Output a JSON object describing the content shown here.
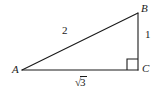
{
  "figure": {
    "type": "right-triangle-diagram",
    "background_color": "#ffffff",
    "stroke_color": "#1a1a1a",
    "vertices": [
      {
        "name": "A",
        "label": "A",
        "x": 22,
        "y": 70
      },
      {
        "name": "B",
        "label": "B",
        "x": 138,
        "y": 13
      },
      {
        "name": "C",
        "label": "C",
        "x": 138,
        "y": 70
      }
    ],
    "sides": [
      {
        "name": "hypotenuse-AB",
        "label": "2",
        "from": "A",
        "to": "B"
      },
      {
        "name": "leg-BC",
        "label": "1",
        "from": "B",
        "to": "C"
      },
      {
        "name": "leg-AC",
        "label_radical_sign": "√",
        "label_radicand": "3",
        "label": "√3",
        "from": "A",
        "to": "C"
      }
    ],
    "right_angle": {
      "at": "C",
      "size": 11,
      "marker": "square"
    }
  }
}
